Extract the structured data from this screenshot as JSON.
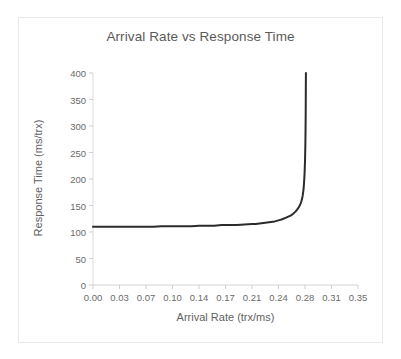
{
  "chart_data": {
    "type": "line",
    "title": "Arrival Rate vs Response Time",
    "xlabel": "Arrival Rate (trx/ms)",
    "ylabel": "Response Time (ms/trx)",
    "xlim": [
      0.0,
      0.35
    ],
    "ylim": [
      0,
      400
    ],
    "grid": false,
    "legend": null,
    "xticks": [
      "0.00",
      "0.03",
      "0.07",
      "0.10",
      "0.14",
      "0.17",
      "0.21",
      "0.24",
      "0.28",
      "0.31",
      "0.35"
    ],
    "xtick_values": [
      0.0,
      0.035,
      0.07,
      0.105,
      0.14,
      0.175,
      0.21,
      0.245,
      0.28,
      0.315,
      0.35
    ],
    "yticks": [
      "0",
      "50",
      "100",
      "150",
      "200",
      "250",
      "300",
      "350",
      "400"
    ],
    "ytick_values": [
      0,
      50,
      100,
      150,
      200,
      250,
      300,
      350,
      400
    ],
    "series": [
      {
        "name": "Response Time",
        "color": "#2b2b2b",
        "line_width": 2,
        "asymptote_x": 0.281,
        "baseline_y": 110,
        "x": [
          0.0,
          0.01,
          0.02,
          0.03,
          0.04,
          0.05,
          0.06,
          0.07,
          0.08,
          0.09,
          0.1,
          0.11,
          0.12,
          0.13,
          0.14,
          0.15,
          0.16,
          0.17,
          0.18,
          0.19,
          0.2,
          0.21,
          0.215,
          0.22,
          0.225,
          0.23,
          0.235,
          0.24,
          0.245,
          0.25,
          0.255,
          0.258,
          0.261,
          0.264,
          0.267,
          0.269,
          0.271,
          0.273,
          0.274,
          0.275,
          0.276,
          0.277,
          0.278,
          0.2785,
          0.279,
          0.2795,
          0.28,
          0.2802,
          0.2805,
          0.2807,
          0.2809,
          0.281,
          0.2811,
          0.2812
        ],
        "y": [
          110,
          110,
          110,
          110,
          110,
          110,
          110,
          110,
          110,
          111,
          111,
          111,
          111,
          111,
          112,
          112,
          112,
          113,
          113,
          113,
          114,
          115,
          115,
          116,
          117,
          118,
          119,
          120,
          122,
          124,
          127,
          129,
          131,
          134,
          138,
          141,
          145,
          150,
          153,
          157,
          162,
          169,
          180,
          188,
          199,
          213,
          233,
          245,
          268,
          290,
          320,
          345,
          375,
          400
        ]
      }
    ]
  },
  "figure": {
    "background_color": "#ffffff",
    "frame_color": "#e8e8e8",
    "axis_color": "#d9d9d9",
    "tick_color": "#cfcfcf",
    "text_color": "#5f5f5f",
    "title_color": "#5a5a5a"
  }
}
